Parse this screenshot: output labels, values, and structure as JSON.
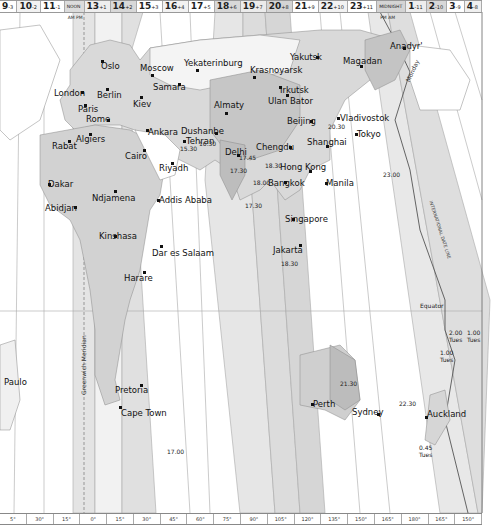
{
  "header": {
    "zones": [
      {
        "hour": "9",
        "offset": "-3",
        "shade": "#ffffff"
      },
      {
        "hour": "10",
        "offset": "-2",
        "shade": "#f2f2f2"
      },
      {
        "hour": "11",
        "offset": "-1",
        "shade": "#ffffff"
      },
      {
        "hour": "NOON",
        "offset": "",
        "shade": "#dcdcdc",
        "sub": "AM PM"
      },
      {
        "hour": "13",
        "offset": "+1",
        "shade": "#eeeeee"
      },
      {
        "hour": "14",
        "offset": "+2",
        "shade": "#d8d8d8"
      },
      {
        "hour": "15",
        "offset": "+3",
        "shade": "#ffffff"
      },
      {
        "hour": "16",
        "offset": "+4",
        "shade": "#f2f2f2"
      },
      {
        "hour": "17",
        "offset": "+5",
        "shade": "#ffffff"
      },
      {
        "hour": "18",
        "offset": "+6",
        "shade": "#d8d8d8"
      },
      {
        "hour": "19",
        "offset": "+7",
        "shade": "#ebebeb"
      },
      {
        "hour": "20",
        "offset": "+8",
        "shade": "#d4d4d4"
      },
      {
        "hour": "21",
        "offset": "+9",
        "shade": "#ffffff"
      },
      {
        "hour": "22",
        "offset": "+10",
        "shade": "#f2f2f2"
      },
      {
        "hour": "23",
        "offset": "+11",
        "shade": "#ffffff"
      },
      {
        "hour": "MIDNIGHT",
        "offset": "",
        "shade": "#d4d4d4",
        "sub": "PM AM"
      },
      {
        "hour": "1",
        "offset": "-11",
        "shade": "#eeeeee"
      },
      {
        "hour": "2",
        "offset": "-10",
        "shade": "#d8d8d8"
      },
      {
        "hour": "3",
        "offset": "-9",
        "shade": "#ffffff"
      },
      {
        "hour": "4",
        "offset": "-8",
        "shade": "#f0f0f0"
      }
    ]
  },
  "footer": {
    "longitudes": [
      "5°",
      "30°",
      "15°",
      "0°",
      "15°",
      "30°",
      "45°",
      "60°",
      "75°",
      "90°",
      "105°",
      "120°",
      "135°",
      "150°",
      "165°",
      "180°",
      "165°",
      "150°"
    ]
  },
  "labels": {
    "meridian": "Greenwich Meridian",
    "date_line": "INTERNATIONAL DATE LINE",
    "monday": "Monday",
    "equator": "Equator"
  },
  "cities": [
    {
      "name": "Oslo",
      "x": 101,
      "y": 54,
      "dx": 101,
      "dy": 52
    },
    {
      "name": "Moscow",
      "x": 140,
      "y": 56,
      "dx": 151,
      "dy": 66
    },
    {
      "name": "Yekaterinburg",
      "x": 184,
      "y": 51,
      "dx": 196,
      "dy": 61
    },
    {
      "name": "Krasnoyarsk",
      "x": 250,
      "y": 58,
      "dx": 253,
      "dy": 68
    },
    {
      "name": "Yakutsk",
      "x": 290,
      "y": 45,
      "dx": 316,
      "dy": 48
    },
    {
      "name": "Magadan",
      "x": 343,
      "y": 49,
      "dx": 360,
      "dy": 57
    },
    {
      "name": "Anadyr'",
      "x": 390,
      "y": 34,
      "dx": 403,
      "dy": 39
    },
    {
      "name": "London",
      "x": 54,
      "y": 81,
      "dx": 81,
      "dy": 83
    },
    {
      "name": "Berlin",
      "x": 97,
      "y": 83,
      "dx": 106,
      "dy": 80
    },
    {
      "name": "Samara",
      "x": 153,
      "y": 75,
      "dx": 178,
      "dy": 75
    },
    {
      "name": "Irkutsk",
      "x": 280,
      "y": 78,
      "dx": 279,
      "dy": 78
    },
    {
      "name": "Ulan Bator",
      "x": 268,
      "y": 89,
      "dx": 286,
      "dy": 86
    },
    {
      "name": "Kiev",
      "x": 133,
      "y": 92,
      "dx": 140,
      "dy": 88
    },
    {
      "name": "Paris",
      "x": 78,
      "y": 97,
      "dx": 84,
      "dy": 96
    },
    {
      "name": "Almaty",
      "x": 214,
      "y": 93,
      "dx": 225,
      "dy": 104
    },
    {
      "name": "Vladivostok",
      "x": 340,
      "y": 106,
      "dx": 337,
      "dy": 109
    },
    {
      "name": "Rome",
      "x": 86,
      "y": 107,
      "dx": 107,
      "dy": 111
    },
    {
      "name": "Beijing",
      "x": 287,
      "y": 109,
      "dx": 310,
      "dy": 112
    },
    {
      "name": "Ankara",
      "x": 148,
      "y": 120,
      "dx": 146,
      "dy": 121
    },
    {
      "name": "Dushanbe",
      "x": 181,
      "y": 119,
      "dx": 215,
      "dy": 124
    },
    {
      "name": "Tokyo",
      "x": 357,
      "y": 122,
      "dx": 355,
      "dy": 125
    },
    {
      "name": "Algiers",
      "x": 76,
      "y": 127,
      "dx": 89,
      "dy": 125
    },
    {
      "name": "Tehran",
      "x": 186,
      "y": 129,
      "dx": 183,
      "dy": 132
    },
    {
      "name": "Rabat",
      "x": 52,
      "y": 134,
      "dx": 68,
      "dy": 132
    },
    {
      "name": "Chengdu",
      "x": 256,
      "y": 135,
      "dx": 289,
      "dy": 138
    },
    {
      "name": "Shanghai",
      "x": 307,
      "y": 130,
      "dx": 326,
      "dy": 137
    },
    {
      "name": "Cairo",
      "x": 125,
      "y": 144,
      "dx": 143,
      "dy": 141
    },
    {
      "name": "Delhi",
      "x": 225,
      "y": 140,
      "dx": 237,
      "dy": 146
    },
    {
      "name": "Hong Kong",
      "x": 280,
      "y": 155,
      "dx": 309,
      "dy": 162
    },
    {
      "name": "Riyadh",
      "x": 159,
      "y": 156,
      "dx": 171,
      "dy": 154
    },
    {
      "name": "Bangkok",
      "x": 268,
      "y": 171,
      "dx": 284,
      "dy": 173
    },
    {
      "name": "Manila",
      "x": 326,
      "y": 171,
      "dx": 325,
      "dy": 174
    },
    {
      "name": "Dakar",
      "x": 48,
      "y": 172,
      "dx": 48,
      "dy": 175
    },
    {
      "name": "Ndjamena",
      "x": 92,
      "y": 186,
      "dx": 114,
      "dy": 182
    },
    {
      "name": "Addis Ababa",
      "x": 159,
      "y": 188,
      "dx": 157,
      "dy": 191
    },
    {
      "name": "Abidjan",
      "x": 45,
      "y": 196,
      "dx": 74,
      "dy": 198
    },
    {
      "name": "Singapore",
      "x": 285,
      "y": 207,
      "dx": 292,
      "dy": 210
    },
    {
      "name": "Kinshasa",
      "x": 99,
      "y": 224,
      "dx": 114,
      "dy": 227
    },
    {
      "name": "Dar es Salaam",
      "x": 152,
      "y": 241,
      "dx": 160,
      "dy": 237
    },
    {
      "name": "Jakarta",
      "x": 273,
      "y": 238,
      "dx": 299,
      "dy": 236
    },
    {
      "name": "Harare",
      "x": 124,
      "y": 266,
      "dx": 143,
      "dy": 263
    },
    {
      "name": "Paulo",
      "x": 4,
      "y": 370,
      "dx": -10,
      "dy": -10
    },
    {
      "name": "Pretoria",
      "x": 115,
      "y": 378,
      "dx": 140,
      "dy": 376
    },
    {
      "name": "Perth",
      "x": 313,
      "y": 392,
      "dx": 311,
      "dy": 395
    },
    {
      "name": "Sydney",
      "x": 352,
      "y": 400,
      "dx": 377,
      "dy": 405
    },
    {
      "name": "Auckland",
      "x": 427,
      "y": 402,
      "dx": 425,
      "dy": 408
    },
    {
      "name": "Cape Town",
      "x": 121,
      "y": 401,
      "dx": 119,
      "dy": 398
    }
  ],
  "notes": [
    {
      "text": "23.00",
      "x": 383,
      "y": 164
    },
    {
      "text": "20.30",
      "x": 328,
      "y": 116
    },
    {
      "text": "15.30",
      "x": 180,
      "y": 138
    },
    {
      "text": "16.30",
      "x": 199,
      "y": 133
    },
    {
      "text": "17.45",
      "x": 239,
      "y": 147
    },
    {
      "text": "17.30",
      "x": 230,
      "y": 160
    },
    {
      "text": "18.30",
      "x": 265,
      "y": 155
    },
    {
      "text": "18.00",
      "x": 253,
      "y": 172
    },
    {
      "text": "17.30",
      "x": 245,
      "y": 195
    },
    {
      "text": "18.30",
      "x": 281,
      "y": 253
    },
    {
      "text": "21.30",
      "x": 340,
      "y": 373
    },
    {
      "text": "22.30",
      "x": 399,
      "y": 393
    },
    {
      "text": "17.00",
      "x": 167,
      "y": 441
    },
    {
      "text": "0.45",
      "x": 419,
      "y": 437
    },
    {
      "text": "Tues",
      "x": 419,
      "y": 444
    },
    {
      "text": "2.00",
      "x": 449,
      "y": 322
    },
    {
      "text": "Tues",
      "x": 449,
      "y": 329
    },
    {
      "text": "1.00",
      "x": 467,
      "y": 322
    },
    {
      "text": "Tues",
      "x": 467,
      "y": 329
    },
    {
      "text": "1.00",
      "x": 440,
      "y": 342
    },
    {
      "text": "Tues",
      "x": 440,
      "y": 349
    }
  ]
}
